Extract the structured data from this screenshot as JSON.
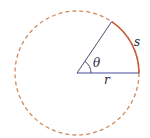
{
  "diagram": {
    "type": "arc-length-circle",
    "circle": {
      "cx": 77,
      "cy": 73,
      "r": 62,
      "stroke": "#d08a5a",
      "style": "dashed"
    },
    "arc": {
      "stroke": "#c5623e",
      "start_deg": 0,
      "end_deg": 56
    },
    "radius_line": {
      "stroke": "#4a4a9a"
    },
    "angle_line": {
      "stroke": "#3a3a5a"
    },
    "labels": {
      "s": "s",
      "theta": "θ",
      "r": "r"
    }
  }
}
